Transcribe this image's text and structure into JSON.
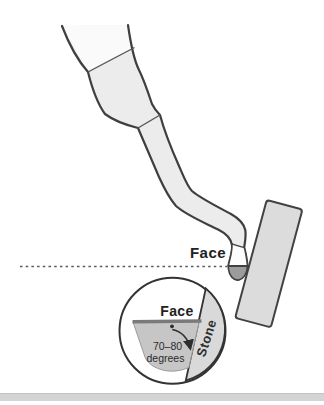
{
  "figure": {
    "type": "instructional-diagram",
    "labels": {
      "face_main": "Face",
      "face_inset": "Face",
      "stone": "Stone",
      "angle_line1": "70–80",
      "angle_line2": "degrees"
    },
    "colors": {
      "outline": "#3f3f3f",
      "instrument_fill": "#ececec",
      "instrument_top_fill": "#fafafa",
      "stone_fill": "#dcdcdc",
      "blade_tip_fill": "#9b9b9b",
      "inset_blade_fill": "#c6c6c6",
      "inset_stone_fill": "#d9d9d9",
      "dashed_line": "#5a5a5a",
      "bottom_bar": "#d4d4d4"
    }
  }
}
